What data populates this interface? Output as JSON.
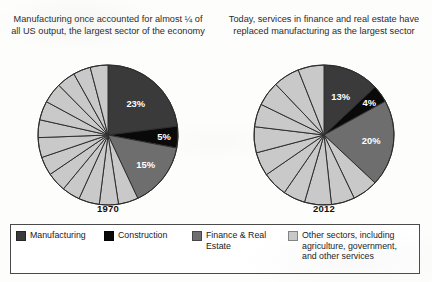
{
  "document": {
    "top_cropped_text": "",
    "background_color": "#fdfdfc"
  },
  "colors": {
    "manufacturing": "#3a3a3a",
    "construction": "#090909",
    "finance_real_estate": "#6e6e6e",
    "other_sectors": "#c9c9c9",
    "slice_outline": "#2e2e2e",
    "label_text": "#ffffff",
    "legend_border": "#4a4a4a"
  },
  "panels": [
    {
      "title": "Manufacturing once accounted for almost ¼ of all US output, the largest sector of the economy",
      "year": "1970"
    },
    {
      "title": "Today, services in finance and real estate have replaced manufacturing as the largest sector",
      "year": "2012"
    }
  ],
  "legend": {
    "items": [
      {
        "label": "Manufacturing",
        "swatch_name": "manufacturing",
        "color": "#3a3a3a"
      },
      {
        "label": "Construction",
        "swatch_name": "construction",
        "color": "#090909"
      },
      {
        "label": "Finance & Real Estate",
        "swatch_name": "finance-real-estate",
        "color": "#6e6e6e"
      },
      {
        "label": "Other sectors, including agriculture, government, and other services",
        "swatch_name": "other-sectors",
        "color": "#c9c9c9"
      }
    ]
  },
  "chart_data": [
    {
      "type": "pie",
      "title": "Manufacturing once accounted for almost ¼ of all US output, the largest sector of the economy",
      "year": "1970",
      "start_angle_deg": 0,
      "direction": "clockwise",
      "units": "percent",
      "labels": [
        "Manufacturing",
        "Construction",
        "Finance & Real Estate",
        "Other sectors, including agriculture, government, and other services"
      ],
      "values": [
        23,
        5,
        15,
        57
      ],
      "displayed_labels": [
        "23%",
        "5%",
        "15%",
        ""
      ],
      "colors": [
        "#3a3a3a",
        "#090909",
        "#6e6e6e",
        "#c9c9c9"
      ],
      "other_subdivisions": [
        4.6,
        4.4,
        4.8,
        4.2,
        4.5,
        4.3,
        4.6,
        4.1,
        4.4,
        4.7,
        4.3,
        4.0,
        4.1
      ],
      "legend_position": "bottom"
    },
    {
      "type": "pie",
      "title": "Today, services in finance and real estate have replaced manufacturing as the largest sector",
      "year": "2012",
      "start_angle_deg": 0,
      "direction": "clockwise",
      "units": "percent",
      "labels": [
        "Manufacturing",
        "Construction",
        "Finance & Real Estate",
        "Other sectors, including agriculture, government, and other services"
      ],
      "values": [
        13,
        4,
        20,
        63
      ],
      "displayed_labels": [
        "13%",
        "4%",
        "20%",
        ""
      ],
      "colors": [
        "#3a3a3a",
        "#090909",
        "#6e6e6e",
        "#c9c9c9"
      ],
      "other_subdivisions": [
        5.9,
        5.4,
        6.2,
        5.1,
        5.8,
        5.5,
        6.0,
        5.3,
        5.7,
        6.1,
        6.0
      ],
      "legend_position": "bottom"
    }
  ]
}
